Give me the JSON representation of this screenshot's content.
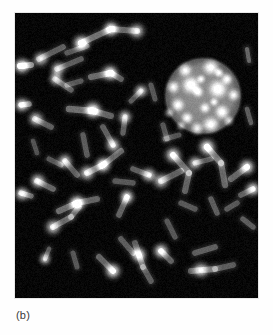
{
  "figure": {
    "caption": "(b)",
    "panel_label": "b",
    "kind": "fluorescence-micrograph",
    "background_color": "#ffffff",
    "panel": {
      "x": 15,
      "y": 13,
      "width": 243,
      "height": 285,
      "background_color": "#040404",
      "border_color": "#e8e8e8"
    },
    "palette": {
      "chromosome_body": "#6e6e6e",
      "chromosome_bright_spot": "#e8e8e8",
      "nucleus_body": "#8a8a8a",
      "nucleus_speckle": "#ededed",
      "panel_black": "#040404",
      "caption_text": "#3a3a3a"
    }
  },
  "chart_data": {
    "type": "scatter",
    "title": "(b)",
    "xlabel": "",
    "ylabel": "",
    "xlim": [
      0,
      243
    ],
    "ylim": [
      0,
      285
    ],
    "grid": false,
    "legend": "none",
    "nucleus": {
      "cx": 188,
      "cy": 83,
      "r": 35,
      "fill": "#8a8a8a",
      "speckles": [
        {
          "x": 170,
          "y": 57,
          "r": 5.0,
          "i": 0.92
        },
        {
          "x": 196,
          "y": 54,
          "r": 6.0,
          "i": 0.95
        },
        {
          "x": 212,
          "y": 66,
          "r": 4.2,
          "i": 0.88
        },
        {
          "x": 158,
          "y": 74,
          "r": 4.6,
          "i": 0.86
        },
        {
          "x": 176,
          "y": 72,
          "r": 6.5,
          "i": 0.98
        },
        {
          "x": 183,
          "y": 79,
          "r": 4.0,
          "i": 0.8
        },
        {
          "x": 203,
          "y": 76,
          "r": 6.8,
          "i": 0.97
        },
        {
          "x": 219,
          "y": 82,
          "r": 4.4,
          "i": 0.84
        },
        {
          "x": 163,
          "y": 92,
          "r": 4.8,
          "i": 0.87
        },
        {
          "x": 190,
          "y": 95,
          "r": 4.0,
          "i": 0.78
        },
        {
          "x": 207,
          "y": 99,
          "r": 5.2,
          "i": 0.9
        },
        {
          "x": 172,
          "y": 105,
          "r": 4.2,
          "i": 0.82
        },
        {
          "x": 154,
          "y": 100,
          "r": 3.6,
          "i": 0.76
        },
        {
          "x": 196,
          "y": 112,
          "r": 6.0,
          "i": 0.94
        },
        {
          "x": 214,
          "y": 108,
          "r": 3.8,
          "i": 0.79
        },
        {
          "x": 182,
          "y": 116,
          "r": 4.6,
          "i": 0.85
        },
        {
          "x": 166,
          "y": 113,
          "r": 3.4,
          "i": 0.74
        },
        {
          "x": 204,
          "y": 60,
          "r": 3.4,
          "i": 0.8
        },
        {
          "x": 186,
          "y": 66,
          "r": 3.2,
          "i": 0.76
        },
        {
          "x": 199,
          "y": 89,
          "r": 3.2,
          "i": 0.75
        }
      ]
    },
    "chromosomes": [
      {
        "x1": 66,
        "y1": 30,
        "x2": 96,
        "y2": 16,
        "w": 6.0,
        "i": 0.62,
        "spots": [
          [
            66,
            30,
            0.95
          ],
          [
            96,
            16,
            0.85
          ]
        ]
      },
      {
        "x1": 96,
        "y1": 16,
        "x2": 122,
        "y2": 18,
        "w": 6.0,
        "i": 0.55,
        "spots": [
          [
            122,
            18,
            0.72
          ]
        ]
      },
      {
        "x1": 24,
        "y1": 46,
        "x2": 48,
        "y2": 34,
        "w": 5.6,
        "i": 0.52,
        "spots": [
          [
            26,
            46,
            0.7
          ]
        ]
      },
      {
        "x1": 42,
        "y1": 56,
        "x2": 66,
        "y2": 46,
        "w": 5.6,
        "i": 0.5,
        "spots": [
          [
            43,
            56,
            0.68
          ]
        ]
      },
      {
        "x1": 52,
        "y1": 40,
        "x2": 72,
        "y2": 33,
        "w": 5.2,
        "i": 0.48,
        "spots": []
      },
      {
        "x1": 5,
        "y1": 53,
        "x2": 16,
        "y2": 52,
        "w": 6.0,
        "i": 0.75,
        "spots": [
          [
            7,
            53,
            0.92
          ]
        ]
      },
      {
        "x1": 40,
        "y1": 66,
        "x2": 56,
        "y2": 77,
        "w": 5.4,
        "i": 0.5,
        "spots": [
          [
            41,
            66,
            0.66
          ]
        ]
      },
      {
        "x1": 52,
        "y1": 72,
        "x2": 66,
        "y2": 68,
        "w": 5.2,
        "i": 0.46,
        "spots": []
      },
      {
        "x1": 76,
        "y1": 64,
        "x2": 96,
        "y2": 60,
        "w": 6.2,
        "i": 0.58,
        "spots": [
          [
            95,
            60,
            0.86
          ]
        ]
      },
      {
        "x1": 96,
        "y1": 60,
        "x2": 106,
        "y2": 66,
        "w": 5.6,
        "i": 0.5,
        "spots": []
      },
      {
        "x1": 6,
        "y1": 92,
        "x2": 14,
        "y2": 91,
        "w": 5.6,
        "i": 0.62,
        "spots": [
          [
            7,
            92,
            0.8
          ]
        ]
      },
      {
        "x1": 20,
        "y1": 106,
        "x2": 36,
        "y2": 114,
        "w": 5.8,
        "i": 0.52,
        "spots": [
          [
            21,
            106,
            0.7
          ]
        ]
      },
      {
        "x1": 54,
        "y1": 96,
        "x2": 78,
        "y2": 98,
        "w": 6.4,
        "i": 0.6,
        "spots": [
          [
            78,
            97,
            0.95
          ]
        ]
      },
      {
        "x1": 78,
        "y1": 98,
        "x2": 96,
        "y2": 103,
        "w": 6.0,
        "i": 0.54,
        "spots": []
      },
      {
        "x1": 88,
        "y1": 114,
        "x2": 98,
        "y2": 132,
        "w": 5.6,
        "i": 0.52,
        "spots": [
          [
            98,
            132,
            0.78
          ]
        ]
      },
      {
        "x1": 68,
        "y1": 122,
        "x2": 72,
        "y2": 142,
        "w": 5.4,
        "i": 0.5,
        "spots": []
      },
      {
        "x1": 108,
        "y1": 120,
        "x2": 110,
        "y2": 104,
        "w": 5.4,
        "i": 0.52,
        "spots": [
          [
            110,
            104,
            0.72
          ]
        ]
      },
      {
        "x1": 88,
        "y1": 152,
        "x2": 106,
        "y2": 138,
        "w": 6.0,
        "i": 0.56,
        "spots": [
          [
            88,
            152,
            0.9
          ]
        ]
      },
      {
        "x1": 72,
        "y1": 160,
        "x2": 88,
        "y2": 152,
        "w": 6.0,
        "i": 0.54,
        "spots": [
          [
            72,
            160,
            0.74
          ]
        ]
      },
      {
        "x1": 50,
        "y1": 148,
        "x2": 62,
        "y2": 162,
        "w": 5.6,
        "i": 0.52,
        "spots": [
          [
            50,
            148,
            0.72
          ]
        ]
      },
      {
        "x1": 34,
        "y1": 146,
        "x2": 46,
        "y2": 152,
        "w": 5.2,
        "i": 0.46,
        "spots": []
      },
      {
        "x1": 22,
        "y1": 168,
        "x2": 38,
        "y2": 176,
        "w": 5.8,
        "i": 0.56,
        "spots": [
          [
            23,
            168,
            0.76
          ]
        ]
      },
      {
        "x1": 6,
        "y1": 180,
        "x2": 16,
        "y2": 183,
        "w": 5.4,
        "i": 0.58,
        "spots": [
          [
            7,
            181,
            0.76
          ]
        ]
      },
      {
        "x1": 44,
        "y1": 198,
        "x2": 62,
        "y2": 190,
        "w": 6.2,
        "i": 0.6,
        "spots": [
          [
            62,
            190,
            0.9
          ]
        ]
      },
      {
        "x1": 62,
        "y1": 190,
        "x2": 82,
        "y2": 186,
        "w": 6.0,
        "i": 0.54,
        "spots": []
      },
      {
        "x1": 38,
        "y1": 214,
        "x2": 56,
        "y2": 204,
        "w": 6.0,
        "i": 0.56,
        "spots": [
          [
            38,
            214,
            0.72
          ]
        ]
      },
      {
        "x1": 56,
        "y1": 204,
        "x2": 64,
        "y2": 194,
        "w": 5.6,
        "i": 0.5,
        "spots": []
      },
      {
        "x1": 104,
        "y1": 202,
        "x2": 112,
        "y2": 184,
        "w": 5.6,
        "i": 0.54,
        "spots": [
          [
            112,
            184,
            0.88
          ]
        ]
      },
      {
        "x1": 106,
        "y1": 226,
        "x2": 118,
        "y2": 240,
        "w": 5.6,
        "i": 0.5,
        "spots": []
      },
      {
        "x1": 84,
        "y1": 244,
        "x2": 98,
        "y2": 258,
        "w": 6.0,
        "i": 0.56,
        "spots": [
          [
            98,
            258,
            0.88
          ]
        ]
      },
      {
        "x1": 120,
        "y1": 230,
        "x2": 128,
        "y2": 254,
        "w": 5.8,
        "i": 0.52,
        "spots": [
          [
            124,
            242,
            0.92
          ]
        ]
      },
      {
        "x1": 128,
        "y1": 254,
        "x2": 136,
        "y2": 268,
        "w": 5.6,
        "i": 0.5,
        "spots": []
      },
      {
        "x1": 146,
        "y1": 238,
        "x2": 156,
        "y2": 248,
        "w": 5.8,
        "i": 0.54,
        "spots": [
          [
            146,
            238,
            0.86
          ]
        ]
      },
      {
        "x1": 180,
        "y1": 240,
        "x2": 200,
        "y2": 234,
        "w": 5.8,
        "i": 0.52,
        "spots": []
      },
      {
        "x1": 176,
        "y1": 258,
        "x2": 200,
        "y2": 256,
        "w": 6.0,
        "i": 0.54,
        "spots": [
          [
            186,
            257,
            0.76
          ]
        ]
      },
      {
        "x1": 200,
        "y1": 256,
        "x2": 218,
        "y2": 252,
        "w": 5.8,
        "i": 0.5,
        "spots": []
      },
      {
        "x1": 158,
        "y1": 142,
        "x2": 174,
        "y2": 160,
        "w": 6.2,
        "i": 0.58,
        "spots": [
          [
            158,
            142,
            0.82
          ]
        ]
      },
      {
        "x1": 174,
        "y1": 160,
        "x2": 170,
        "y2": 178,
        "w": 6.0,
        "i": 0.54,
        "spots": []
      },
      {
        "x1": 146,
        "y1": 168,
        "x2": 166,
        "y2": 158,
        "w": 6.0,
        "i": 0.52,
        "spots": [
          [
            146,
            168,
            0.7
          ]
        ]
      },
      {
        "x1": 192,
        "y1": 134,
        "x2": 206,
        "y2": 150,
        "w": 6.4,
        "i": 0.6,
        "spots": [
          [
            192,
            134,
            0.92
          ]
        ]
      },
      {
        "x1": 206,
        "y1": 150,
        "x2": 210,
        "y2": 172,
        "w": 6.2,
        "i": 0.56,
        "spots": []
      },
      {
        "x1": 180,
        "y1": 150,
        "x2": 196,
        "y2": 146,
        "w": 5.4,
        "i": 0.48,
        "spots": [
          [
            180,
            150,
            0.7
          ]
        ]
      },
      {
        "x1": 216,
        "y1": 166,
        "x2": 232,
        "y2": 154,
        "w": 6.0,
        "i": 0.56,
        "spots": [
          [
            232,
            154,
            0.88
          ]
        ]
      },
      {
        "x1": 226,
        "y1": 182,
        "x2": 238,
        "y2": 176,
        "w": 5.6,
        "i": 0.52,
        "spots": [
          [
            238,
            176,
            0.8
          ]
        ]
      },
      {
        "x1": 212,
        "y1": 196,
        "x2": 222,
        "y2": 190,
        "w": 5.4,
        "i": 0.48,
        "spots": []
      },
      {
        "x1": 196,
        "y1": 186,
        "x2": 202,
        "y2": 200,
        "w": 5.4,
        "i": 0.5,
        "spots": []
      },
      {
        "x1": 166,
        "y1": 190,
        "x2": 180,
        "y2": 196,
        "w": 5.4,
        "i": 0.48,
        "spots": []
      },
      {
        "x1": 118,
        "y1": 156,
        "x2": 134,
        "y2": 162,
        "w": 5.6,
        "i": 0.5,
        "spots": [
          [
            134,
            162,
            0.78
          ]
        ]
      },
      {
        "x1": 100,
        "y1": 168,
        "x2": 118,
        "y2": 170,
        "w": 5.4,
        "i": 0.48,
        "spots": []
      },
      {
        "x1": 148,
        "y1": 112,
        "x2": 152,
        "y2": 126,
        "w": 5.2,
        "i": 0.46,
        "spots": []
      },
      {
        "x1": 232,
        "y1": 36,
        "x2": 234,
        "y2": 48,
        "w": 4.2,
        "i": 0.55,
        "spots": []
      },
      {
        "x1": 232,
        "y1": 96,
        "x2": 236,
        "y2": 110,
        "w": 4.6,
        "i": 0.5,
        "spots": []
      },
      {
        "x1": 228,
        "y1": 206,
        "x2": 238,
        "y2": 214,
        "w": 5.4,
        "i": 0.5,
        "spots": []
      },
      {
        "x1": 152,
        "y1": 208,
        "x2": 160,
        "y2": 224,
        "w": 5.2,
        "i": 0.46,
        "spots": []
      },
      {
        "x1": 58,
        "y1": 240,
        "x2": 62,
        "y2": 254,
        "w": 5.0,
        "i": 0.46,
        "spots": []
      },
      {
        "x1": 30,
        "y1": 246,
        "x2": 34,
        "y2": 236,
        "w": 4.6,
        "i": 0.5,
        "spots": [
          [
            30,
            246,
            0.66
          ]
        ]
      },
      {
        "x1": 18,
        "y1": 128,
        "x2": 22,
        "y2": 140,
        "w": 4.6,
        "i": 0.44,
        "spots": []
      },
      {
        "x1": 116,
        "y1": 88,
        "x2": 126,
        "y2": 78,
        "w": 5.2,
        "i": 0.48,
        "spots": [
          [
            126,
            78,
            0.74
          ]
        ]
      },
      {
        "x1": 136,
        "y1": 72,
        "x2": 140,
        "y2": 86,
        "w": 5.0,
        "i": 0.46,
        "spots": []
      },
      {
        "x1": 150,
        "y1": 126,
        "x2": 164,
        "y2": 122,
        "w": 5.0,
        "i": 0.44,
        "spots": []
      }
    ]
  }
}
